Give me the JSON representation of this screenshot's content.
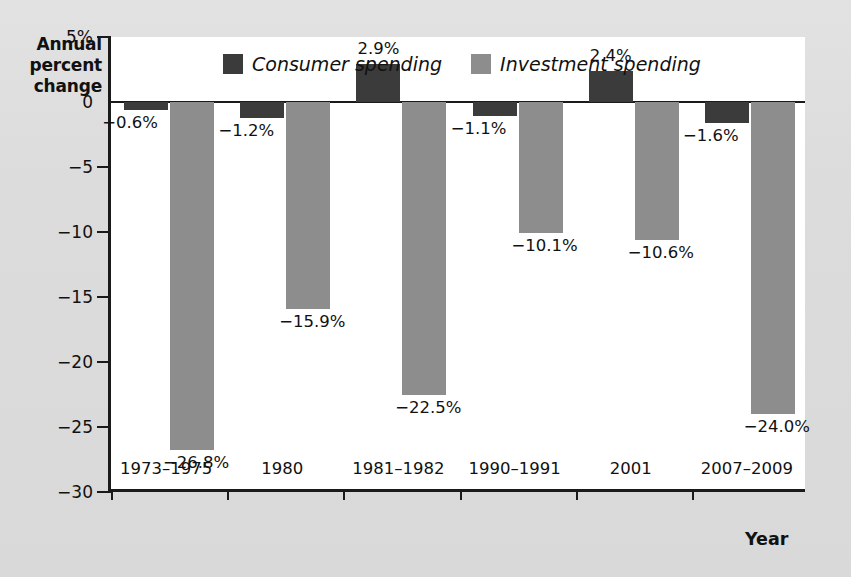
{
  "chart_data": {
    "type": "bar",
    "title": "",
    "ylabel": "Annual percent change",
    "xlabel": "Year",
    "ylim": [
      -30,
      5
    ],
    "grid": false,
    "legend_position": "top-center",
    "y_ticks": [
      {
        "value": 5,
        "label": "5%"
      },
      {
        "value": 0,
        "label": "0"
      },
      {
        "value": -5,
        "label": "−5"
      },
      {
        "value": -10,
        "label": "−10"
      },
      {
        "value": -15,
        "label": "−15"
      },
      {
        "value": -20,
        "label": "−20"
      },
      {
        "value": -25,
        "label": "−25"
      },
      {
        "value": -30,
        "label": "−30"
      }
    ],
    "categories": [
      "1973–1975",
      "1980",
      "1981–1982",
      "1990–1991",
      "2001",
      "2007–2009"
    ],
    "series": [
      {
        "name": "Consumer spending",
        "color": "#3b3b3b",
        "values": [
          -0.6,
          -1.2,
          2.9,
          -1.1,
          2.4,
          -1.6
        ],
        "labels": [
          "−0.6%",
          "−1.2%",
          "2.9%",
          "−1.1%",
          "2.4%",
          "−1.6%"
        ]
      },
      {
        "name": "Investment spending",
        "color": "#8d8d8d",
        "values": [
          -26.8,
          -15.9,
          -22.5,
          -10.1,
          -10.6,
          -24.0
        ],
        "labels": [
          "−26.8%",
          "−15.9%",
          "−22.5%",
          "−10.1%",
          "−10.6%",
          "−24.0%"
        ]
      }
    ]
  },
  "axis": {
    "y_title_line1": "Annual",
    "y_title_line2": "percent",
    "y_title_line3": "change",
    "x_title": "Year"
  },
  "legend": {
    "items": [
      {
        "label": "Consumer spending",
        "color": "#3b3b3b"
      },
      {
        "label": "Investment spending",
        "color": "#8d8d8d"
      }
    ]
  }
}
